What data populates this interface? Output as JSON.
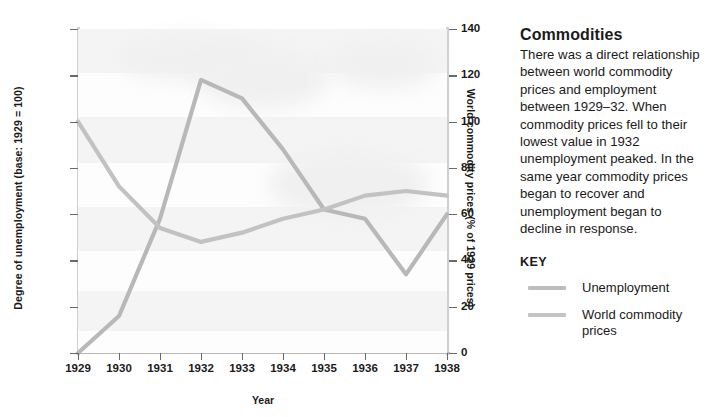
{
  "chart_data": {
    "type": "line",
    "title": "",
    "xlabel": "Year",
    "ylabel": "Degree of unemployment (base: 1929 = 100)",
    "y2label": "World commodity prices (% of 1929 prices)",
    "x": [
      1929,
      1930,
      1931,
      1932,
      1933,
      1934,
      1935,
      1936,
      1937,
      1938
    ],
    "categories": [
      "1929",
      "1930",
      "1931",
      "1932",
      "1933",
      "1934",
      "1935",
      "1936",
      "1937",
      "1938"
    ],
    "xlim": [
      1929,
      1938
    ],
    "ylim": [
      100,
      450
    ],
    "y2lim": [
      0,
      140
    ],
    "yticks": [
      100,
      150,
      200,
      250,
      300,
      350,
      400,
      450
    ],
    "y2ticks": [
      0,
      20,
      40,
      60,
      80,
      100,
      120,
      140
    ],
    "grid": false,
    "legend_position": "right-panel",
    "series": [
      {
        "name": "Unemployment",
        "axis": "left",
        "unit": "index (1929 = 100)",
        "color": "#b8b8b8",
        "values": [
          100,
          140,
          245,
          395,
          375,
          320,
          255,
          245,
          185,
          250
        ]
      },
      {
        "name": "World commodity prices",
        "axis": "right",
        "unit": "% of 1929 prices",
        "color": "#c2c2c2",
        "values": [
          100,
          72,
          54,
          48,
          52,
          58,
          62,
          68,
          70,
          68
        ]
      }
    ]
  },
  "panel": {
    "heading": "Commodities",
    "body": "There was a direct relationship between world commodity prices and employment between 1929–32. When commodity prices fell to their lowest value in 1932 unemployment peaked. In the same year commodity prices began to recover and unemployment began to decline in response.",
    "key_title": "KEY",
    "key_items": [
      {
        "label": "Unemployment",
        "color": "#bdbdbd"
      },
      {
        "label": "World commodity prices",
        "color": "#c4c4c4"
      }
    ]
  }
}
